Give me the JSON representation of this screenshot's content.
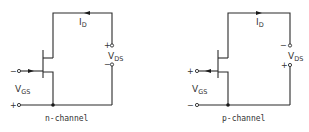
{
  "figure": {
    "panels": [
      {
        "id": "n-channel",
        "caption": "n-channel",
        "drain_current_label": "I",
        "drain_current_sub": "D",
        "vds_label": "V",
        "vds_sub": "DS",
        "vds_top_sign": "+",
        "vds_bottom_sign": "−",
        "vgs_label": "V",
        "vgs_sub": "GS",
        "gate_sign": "−",
        "source_sign": "+",
        "current_arrow_direction": "left",
        "gate_arrow_direction": "right"
      },
      {
        "id": "p-channel",
        "caption": "p-channel",
        "drain_current_label": "I",
        "drain_current_sub": "D",
        "vds_label": "V",
        "vds_sub": "DS",
        "vds_top_sign": "−",
        "vds_bottom_sign": "+",
        "vgs_label": "V",
        "vgs_sub": "GS",
        "gate_sign": "+",
        "source_sign": "−",
        "current_arrow_direction": "right",
        "gate_arrow_direction": "left"
      }
    ],
    "colors": {
      "line": "#2a2a2a",
      "background": "#ffffff"
    }
  }
}
